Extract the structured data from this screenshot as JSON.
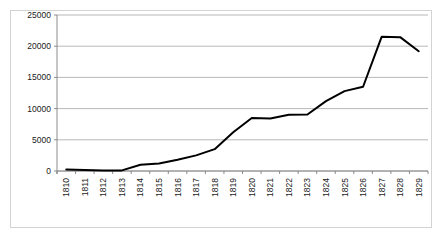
{
  "chart_data": {
    "type": "line",
    "title": "",
    "subtitle": "",
    "xlabel": "",
    "ylabel": "",
    "categories": [
      "1810",
      "1811",
      "1812",
      "1813",
      "1814",
      "1815",
      "1816",
      "1817",
      "1818",
      "1819",
      "1820",
      "1821",
      "1822",
      "1823",
      "1824",
      "1825",
      "1826",
      "1827",
      "1828",
      "1829"
    ],
    "values": [
      250,
      150,
      100,
      100,
      1000,
      1200,
      1800,
      2500,
      3500,
      6200,
      8500,
      8400,
      9000,
      9050,
      11200,
      12800,
      13500,
      21500,
      21450,
      19200
    ],
    "series": [
      {
        "name": "",
        "values": [
          250,
          150,
          100,
          100,
          1000,
          1200,
          1800,
          2500,
          3500,
          6200,
          8500,
          8400,
          9000,
          9050,
          11200,
          12800,
          13500,
          21500,
          21450,
          19200
        ]
      }
    ],
    "ylim": [
      0,
      25000
    ],
    "ytick_values": [
      0,
      5000,
      10000,
      15000,
      20000,
      25000
    ],
    "ytick_labels": [
      "0",
      "5000",
      "10000",
      "15000",
      "20000",
      "25000"
    ],
    "xtick_labels": [
      "1810",
      "1811",
      "1812",
      "1813",
      "1814",
      "1815",
      "1816",
      "1817",
      "1818",
      "1819",
      "1820",
      "1821",
      "1822",
      "1823",
      "1824",
      "1825",
      "1826",
      "1827",
      "1828",
      "1829"
    ],
    "xtick_rotation": -90,
    "grid": {
      "horizontal": true,
      "vertical": false,
      "color": "#a6a6a6"
    },
    "legend": {
      "visible": false,
      "position": "none"
    },
    "annotations": [],
    "style": {
      "line_color": "#000000",
      "line_width": 2,
      "plot_background": "#ffffff",
      "frame_border_color": "#d3d3d3",
      "axis_color": "#808080",
      "tick_text_color": "#1a1a1a"
    }
  }
}
